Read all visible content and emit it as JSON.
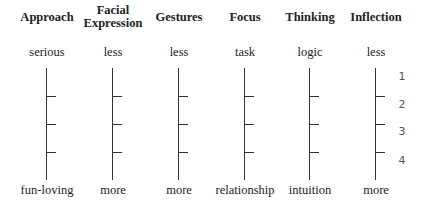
{
  "columns": [
    {
      "header": "Approach",
      "top": "serious",
      "bottom": "fun-loving"
    },
    {
      "header": "Facial Expression",
      "header_lines": [
        "Facial",
        "Expression"
      ],
      "top": "less",
      "bottom": "more"
    },
    {
      "header": "Gestures",
      "top": "less",
      "bottom": "more"
    },
    {
      "header": "Focus",
      "top": "task",
      "bottom": "relationship"
    },
    {
      "header": "Thinking",
      "top": "logic",
      "bottom": "intuition"
    },
    {
      "header": "Inflection",
      "top": "less",
      "bottom": "more"
    }
  ],
  "scale_numbers": [
    "1",
    "2",
    "3",
    "4"
  ]
}
